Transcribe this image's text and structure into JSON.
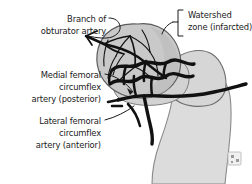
{
  "figure": {
    "background_color": "#ffffff",
    "ink_color": "#1a1a1a",
    "bone_color": "#dcdcdc",
    "head_color": "#c9c9c9",
    "vessel_color": "#111111"
  },
  "labels": {
    "obturator": {
      "line1": "Branch of",
      "line2": "obturator artery",
      "align": "right",
      "leader": "curved-hook-to-vessel-branch"
    },
    "watershed": {
      "line1": "Watershed",
      "line2": "zone (infarcted)",
      "align": "left",
      "leader": "square-bracket"
    },
    "medial": {
      "line1": "Medial femoral",
      "line2": "circumflex",
      "line3": "artery (posterior)",
      "align": "right",
      "leader": "straight-with-arrowhead"
    },
    "lateral": {
      "line1": "Lateral femoral",
      "line2": "circumflex",
      "line3": "artery (anterior)",
      "align": "right",
      "leader": "straight-line"
    }
  },
  "anatomy": {
    "parts": [
      "femoral-head",
      "femoral-neck",
      "greater-trochanter",
      "femoral-shaft"
    ],
    "vessels": [
      "obturator-artery-branch",
      "retinacular-arcade",
      "medial-femoral-circumflex-artery",
      "lateral-femoral-circumflex-artery",
      "ascending-cervical-branches"
    ]
  },
  "watermark": {
    "icon": "broken-image-icon"
  }
}
